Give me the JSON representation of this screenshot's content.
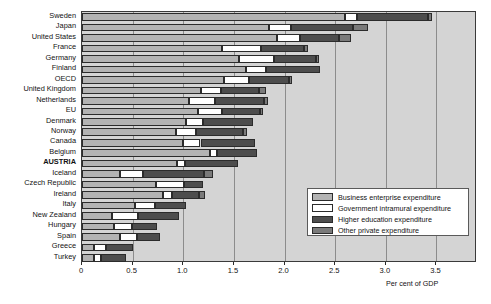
{
  "chart_data": {
    "type": "bar",
    "orientation": "horizontal",
    "stacked": true,
    "title": "",
    "xlabel": "Per cent of GDP",
    "ylabel": "",
    "xlim": [
      0,
      3.9
    ],
    "xticks": [
      0,
      0.5,
      1.0,
      1.5,
      2.0,
      2.5,
      3.0,
      3.5
    ],
    "xtick_labels": [
      "0",
      "0.5",
      "1.0",
      "1.5",
      "2.0",
      "2.5",
      "3.0",
      "3.5"
    ],
    "grid": true,
    "legend_position": "inside-lower-right",
    "categories": [
      "Sweden",
      "Japan",
      "United States",
      "France",
      "Germany",
      "Finland",
      "OECD",
      "United Kingdom",
      "Netherlands",
      "EU",
      "Denmark",
      "Norway",
      "Canada",
      "Belgium",
      "AUSTRIA",
      "Iceland",
      "Czech Republic",
      "Ireland",
      "Italy",
      "New Zealand",
      "Hungary",
      "Spain",
      "Greece",
      "Turkey"
    ],
    "highlight_category": "AUSTRIA",
    "series": [
      {
        "name": "Business enterprise expenditure",
        "color": "#b3b3b3",
        "values": [
          2.6,
          1.85,
          1.93,
          1.38,
          1.55,
          1.62,
          1.4,
          1.17,
          1.06,
          1.15,
          1.03,
          0.93,
          1.0,
          1.26,
          0.94,
          0.38,
          0.73,
          0.8,
          0.52,
          0.3,
          0.32,
          0.38,
          0.12,
          0.12
        ]
      },
      {
        "name": "Government intramural expenditure",
        "color": "#ffffff",
        "values": [
          0.12,
          0.21,
          0.22,
          0.39,
          0.35,
          0.2,
          0.25,
          0.2,
          0.25,
          0.23,
          0.16,
          0.2,
          0.17,
          0.07,
          0.08,
          0.22,
          0.28,
          0.09,
          0.2,
          0.25,
          0.17,
          0.16,
          0.12,
          0.07
        ]
      },
      {
        "name": "Higher education expenditure",
        "color": "#4d4d4d",
        "values": [
          0.7,
          0.62,
          0.39,
          0.42,
          0.41,
          0.53,
          0.39,
          0.38,
          0.49,
          0.38,
          0.5,
          0.46,
          0.54,
          0.4,
          0.52,
          0.6,
          0.18,
          0.27,
          0.31,
          0.41,
          0.25,
          0.23,
          0.26,
          0.24
        ]
      },
      {
        "name": "Other private expenditure",
        "color": "#7a7a7a",
        "values": [
          0.04,
          0.14,
          0.12,
          0.04,
          0.03,
          0.0,
          0.03,
          0.07,
          0.04,
          0.03,
          0.0,
          0.04,
          0.0,
          0.0,
          0.0,
          0.09,
          0.0,
          0.05,
          0.0,
          0.0,
          0.0,
          0.0,
          0.0,
          0.0
        ]
      }
    ],
    "totals": [
      3.46,
      2.82,
      2.66,
      2.23,
      2.34,
      2.35,
      2.07,
      1.82,
      1.84,
      1.79,
      1.69,
      1.63,
      1.71,
      1.73,
      1.54,
      1.29,
      1.19,
      1.21,
      1.03,
      0.96,
      0.74,
      0.77,
      0.5,
      0.43
    ]
  },
  "legend": {
    "items": [
      {
        "label": "Business enterprise expenditure",
        "color": "#b3b3b3"
      },
      {
        "label": "Government intramural expenditure",
        "color": "#ffffff"
      },
      {
        "label": "Higher education expenditure",
        "color": "#4d4d4d"
      },
      {
        "label": "Other private expenditure",
        "color": "#7a7a7a"
      }
    ]
  }
}
